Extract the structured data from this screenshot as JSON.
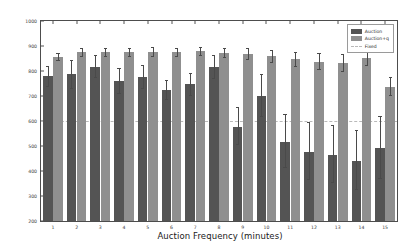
{
  "chart_data": {
    "type": "bar",
    "title": "",
    "xlabel": "Auction Frequency (minutes)",
    "ylabel": "Throughput (vehicles/hour)",
    "categories": [
      "1",
      "2",
      "3",
      "4",
      "5",
      "6",
      "7",
      "8",
      "9",
      "10",
      "11",
      "12",
      "13",
      "14",
      "15"
    ],
    "ylim": [
      200,
      1000
    ],
    "yticks": [
      200,
      300,
      400,
      500,
      600,
      700,
      800,
      900,
      1000
    ],
    "grid": false,
    "legend_position": "top-right",
    "series": [
      {
        "name": "Auction",
        "color": "#545454",
        "values": [
          780,
          788,
          818,
          762,
          777,
          725,
          748,
          818,
          578,
          700,
          517,
          478,
          466,
          442,
          492
        ],
        "err_low": [
          40,
          55,
          42,
          48,
          45,
          38,
          42,
          45,
          70,
          80,
          100,
          110,
          108,
          112,
          118
        ],
        "err_high": [
          42,
          58,
          45,
          50,
          48,
          40,
          45,
          48,
          80,
          88,
          110,
          120,
          118,
          122,
          128
        ]
      },
      {
        "name": "Auction+q",
        "color": "#8f8f8f",
        "values": [
          858,
          877,
          877,
          877,
          878,
          877,
          879,
          873,
          869,
          860,
          848,
          838,
          833,
          852,
          737
        ],
        "err_low": [
          14,
          16,
          16,
          16,
          16,
          16,
          16,
          18,
          20,
          22,
          28,
          30,
          32,
          28,
          34
        ],
        "err_high": [
          15,
          17,
          17,
          17,
          17,
          17,
          17,
          19,
          22,
          24,
          30,
          34,
          36,
          30,
          38
        ]
      }
    ],
    "reference_line": {
      "name": "Fixed",
      "value": 600,
      "style": "dashed",
      "color": "#b9b9b9"
    },
    "legend": [
      {
        "label": "Auction",
        "swatch": "auction"
      },
      {
        "label": "Auction+q",
        "swatch": "auctionq"
      },
      {
        "label": "Fixed",
        "swatch": "fixed"
      }
    ]
  }
}
